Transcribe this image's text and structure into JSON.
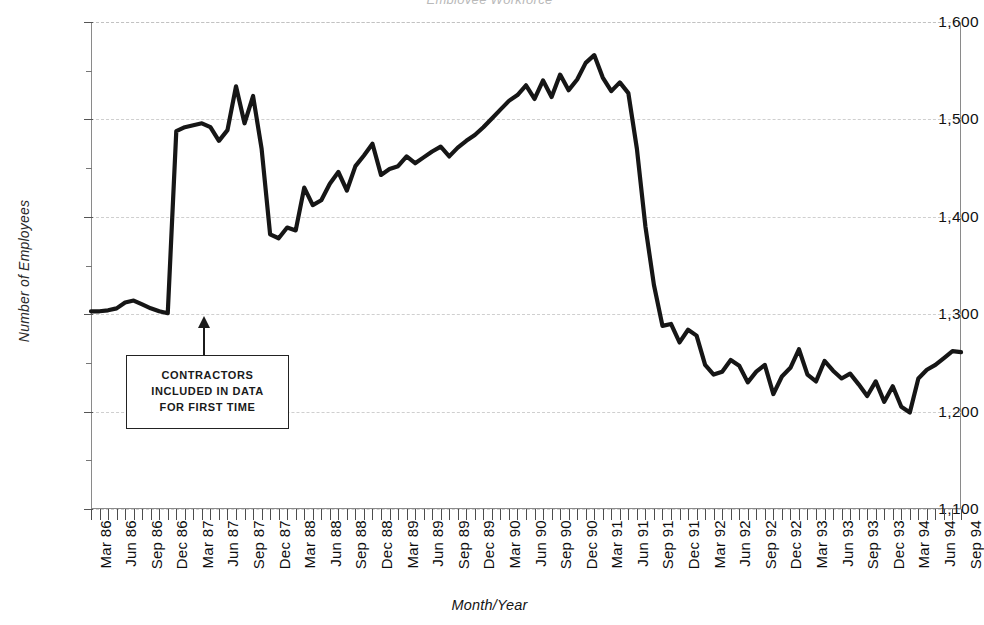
{
  "chart_data": {
    "type": "line",
    "title": "Employee Workforce",
    "xlabel": "Month/Year",
    "ylabel": "Number of Employees",
    "ylim": [
      1100,
      1600
    ],
    "ytick_labels": [
      "1,600",
      "1,500",
      "1,400",
      "1,300",
      "1,200",
      "1,100"
    ],
    "ytick_values": [
      1600,
      1500,
      1400,
      1300,
      1200,
      1100
    ],
    "yminor_values": [
      1550,
      1450,
      1350,
      1250,
      1150
    ],
    "grid": true,
    "legend": "none",
    "x_tick_labels": [
      "Mar 86",
      "Jun 86",
      "Sep 86",
      "Dec 86",
      "Mar 87",
      "Jun 87",
      "Sep 87",
      "Dec 87",
      "Mar 88",
      "Jun 88",
      "Sep 88",
      "Dec 88",
      "Mar 89",
      "Jun 89",
      "Sep 89",
      "Dec 89",
      "Mar 90",
      "Jun 90",
      "Sep 90",
      "Dec 90",
      "Mar 91",
      "Jun 91",
      "Sep 91",
      "Dec 91",
      "Mar 92",
      "Jun 92",
      "Sep 92",
      "Dec 92",
      "Mar 93",
      "Jun 93",
      "Sep 93",
      "Dec 93",
      "Mar 94",
      "Jun 94",
      "Sep 94"
    ],
    "x_tick_interval": "monthly",
    "x_label_interval": "quarterly",
    "series": [
      {
        "name": "Number of Employees",
        "x": [
          "Mar 86",
          "Apr 86",
          "May 86",
          "Jun 86",
          "Jul 86",
          "Aug 86",
          "Sep 86",
          "Oct 86",
          "Nov 86",
          "Dec 86",
          "Jan 87",
          "Feb 87",
          "Mar 87",
          "Apr 87",
          "May 87",
          "Jun 87",
          "Jul 87",
          "Aug 87",
          "Sep 87",
          "Oct 87",
          "Nov 87",
          "Dec 87",
          "Jan 88",
          "Feb 88",
          "Mar 88",
          "Apr 88",
          "May 88",
          "Jun 88",
          "Jul 88",
          "Aug 88",
          "Sep 88",
          "Oct 88",
          "Nov 88",
          "Dec 88",
          "Jan 89",
          "Feb 89",
          "Mar 89",
          "Apr 89",
          "May 89",
          "Jun 89",
          "Jul 89",
          "Aug 89",
          "Sep 89",
          "Oct 89",
          "Nov 89",
          "Dec 89",
          "Jan 90",
          "Feb 90",
          "Mar 90",
          "Apr 90",
          "May 90",
          "Jun 90",
          "Jul 90",
          "Aug 90",
          "Sep 90",
          "Oct 90",
          "Nov 90",
          "Dec 90",
          "Jan 91",
          "Feb 91",
          "Mar 91",
          "Apr 91",
          "May 91",
          "Jun 91",
          "Jul 91",
          "Aug 91",
          "Sep 91",
          "Oct 91",
          "Nov 91",
          "Dec 91",
          "Jan 92",
          "Feb 92",
          "Mar 92",
          "Apr 92",
          "May 92",
          "Jun 92",
          "Jul 92",
          "Aug 92",
          "Sep 92",
          "Oct 92",
          "Nov 92",
          "Dec 92",
          "Jan 93",
          "Feb 93",
          "Mar 93",
          "Apr 93",
          "May 93",
          "Jun 93",
          "Jul 93",
          "Aug 93",
          "Sep 93",
          "Oct 93",
          "Nov 93",
          "Dec 93",
          "Jan 94",
          "Feb 94",
          "Mar 94",
          "Apr 94",
          "May 94",
          "Jun 94",
          "Jul 94",
          "Aug 94",
          "Sep 94"
        ],
        "values": [
          1303,
          1303,
          1304,
          1306,
          1312,
          1314,
          1310,
          1306,
          1303,
          1301,
          1488,
          1492,
          1494,
          1496,
          1492,
          1478,
          1489,
          1534,
          1496,
          1524,
          1470,
          1382,
          1378,
          1389,
          1386,
          1430,
          1412,
          1417,
          1434,
          1446,
          1427,
          1452,
          1463,
          1475,
          1443,
          1449,
          1452,
          1462,
          1455,
          1461,
          1467,
          1472,
          1462,
          1471,
          1478,
          1484,
          1492,
          1501,
          1510,
          1519,
          1525,
          1535,
          1521,
          1540,
          1523,
          1546,
          1530,
          1541,
          1558,
          1566,
          1543,
          1529,
          1538,
          1527,
          1470,
          1390,
          1330,
          1288,
          1290,
          1271,
          1284,
          1278,
          1248,
          1238,
          1241,
          1253,
          1247,
          1230,
          1241,
          1248,
          1218,
          1236,
          1245,
          1264,
          1238,
          1231,
          1252,
          1242,
          1234,
          1239,
          1228,
          1216,
          1231,
          1210,
          1226,
          1205,
          1199,
          1234,
          1243,
          1248,
          1255,
          1262,
          1261
        ]
      }
    ],
    "annotation": {
      "lines": [
        "CONTRACTORS",
        "INCLUDED IN DATA",
        "FOR FIRST TIME"
      ],
      "points_at": "Dec 86"
    }
  }
}
